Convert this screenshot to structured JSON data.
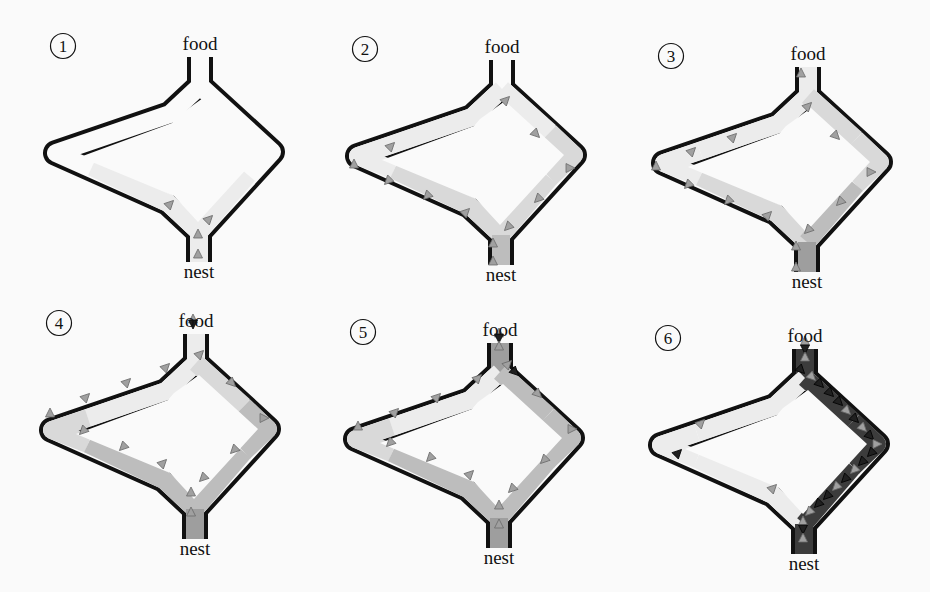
{
  "figure": {
    "background": "#fafafa",
    "wall_color": "#111111",
    "colors": {
      "none": "#fafafa",
      "faint": "#ececec",
      "light": "#d9d9d9",
      "medium": "#bdbdbd",
      "strong": "#9e9e9e",
      "dark": "#3c3c3c"
    },
    "ant_colors": {
      "gray": "#a0a0a0",
      "black": "#202020"
    }
  },
  "panels": [
    {
      "number": "①",
      "food_label": "food",
      "nest_label": "nest",
      "dx": 0,
      "dy": 0,
      "segments": {
        "top_stem": "none",
        "upper_left": "none",
        "upper_right": "none",
        "lower_left": "faint",
        "lower_right": "faint",
        "bottom_stem": "faint",
        "left_tip": "none",
        "right_tip": "none"
      },
      "ants": [
        {
          "x": 170,
          "y": 204,
          "dir": "ne",
          "c": "gray"
        },
        {
          "x": 209,
          "y": 219,
          "dir": "ne",
          "c": "gray"
        },
        {
          "x": 198,
          "y": 234,
          "dir": "n",
          "c": "gray"
        },
        {
          "x": 198,
          "y": 254,
          "dir": "n",
          "c": "gray"
        }
      ]
    },
    {
      "number": "②",
      "food_label": "food",
      "nest_label": "nest",
      "dx": 302,
      "dy": 3,
      "segments": {
        "top_stem": "none",
        "upper_left": "faint",
        "upper_right": "faint",
        "lower_left": "light",
        "lower_right": "light",
        "bottom_stem": "medium",
        "left_tip": "faint",
        "right_tip": "light"
      },
      "ants": [
        {
          "x": 204,
          "y": 97,
          "dir": "ne",
          "c": "gray"
        },
        {
          "x": 234,
          "y": 131,
          "dir": "se",
          "c": "gray"
        },
        {
          "x": 268,
          "y": 165,
          "dir": "e",
          "c": "gray"
        },
        {
          "x": 236,
          "y": 196,
          "dir": "sw",
          "c": "gray"
        },
        {
          "x": 206,
          "y": 224,
          "dir": "sw",
          "c": "gray"
        },
        {
          "x": 89,
          "y": 143,
          "dir": "ne",
          "c": "gray"
        },
        {
          "x": 52,
          "y": 161,
          "dir": "n",
          "c": "gray"
        },
        {
          "x": 86,
          "y": 178,
          "dir": "sw",
          "c": "gray"
        },
        {
          "x": 125,
          "y": 193,
          "dir": "sw",
          "c": "gray"
        },
        {
          "x": 164,
          "y": 209,
          "dir": "ne",
          "c": "gray"
        },
        {
          "x": 191,
          "y": 240,
          "dir": "n",
          "c": "gray"
        },
        {
          "x": 191,
          "y": 258,
          "dir": "n",
          "c": "gray"
        }
      ]
    },
    {
      "number": "③",
      "food_label": "food",
      "nest_label": "nest",
      "dx": 608,
      "dy": 10,
      "segments": {
        "top_stem": "faint",
        "upper_left": "faint",
        "upper_right": "light",
        "lower_left": "light",
        "lower_right": "medium",
        "bottom_stem": "strong",
        "left_tip": "faint",
        "right_tip": "light"
      },
      "ants": [
        {
          "x": 193,
          "y": 63,
          "dir": "n",
          "c": "gray"
        },
        {
          "x": 200,
          "y": 96,
          "dir": "ne",
          "c": "gray"
        },
        {
          "x": 228,
          "y": 126,
          "dir": "se",
          "c": "gray"
        },
        {
          "x": 263,
          "y": 162,
          "dir": "e",
          "c": "gray"
        },
        {
          "x": 232,
          "y": 192,
          "dir": "sw",
          "c": "gray"
        },
        {
          "x": 200,
          "y": 220,
          "dir": "sw",
          "c": "gray"
        },
        {
          "x": 125,
          "y": 127,
          "dir": "ne",
          "c": "gray"
        },
        {
          "x": 84,
          "y": 141,
          "dir": "ne",
          "c": "gray"
        },
        {
          "x": 48,
          "y": 156,
          "dir": "n",
          "c": "gray"
        },
        {
          "x": 80,
          "y": 175,
          "dir": "sw",
          "c": "gray"
        },
        {
          "x": 120,
          "y": 191,
          "dir": "sw",
          "c": "gray"
        },
        {
          "x": 160,
          "y": 205,
          "dir": "ne",
          "c": "gray"
        },
        {
          "x": 188,
          "y": 236,
          "dir": "n",
          "c": "gray"
        },
        {
          "x": 188,
          "y": 257,
          "dir": "n",
          "c": "gray"
        }
      ]
    },
    {
      "number": "④",
      "food_label": "food",
      "nest_label": "nest",
      "dx": -4,
      "dy": 277,
      "segments": {
        "top_stem": "faint",
        "upper_left": "faint",
        "upper_right": "light",
        "lower_left": "medium",
        "lower_right": "medium",
        "bottom_stem": "strong",
        "left_tip": "light",
        "right_tip": "medium"
      },
      "ants": [
        {
          "x": 197,
          "y": 42,
          "dir": "n",
          "c": "gray"
        },
        {
          "x": 197,
          "y": 47,
          "dir": "s",
          "c": "black"
        },
        {
          "x": 204,
          "y": 77,
          "dir": "ne",
          "c": "gray"
        },
        {
          "x": 170,
          "y": 90,
          "dir": "ne",
          "c": "gray"
        },
        {
          "x": 131,
          "y": 105,
          "dir": "ne",
          "c": "gray"
        },
        {
          "x": 90,
          "y": 120,
          "dir": "ne",
          "c": "gray"
        },
        {
          "x": 54,
          "y": 136,
          "dir": "n",
          "c": "gray"
        },
        {
          "x": 236,
          "y": 106,
          "dir": "se",
          "c": "gray"
        },
        {
          "x": 268,
          "y": 141,
          "dir": "e",
          "c": "gray"
        },
        {
          "x": 238,
          "y": 173,
          "dir": "sw",
          "c": "gray"
        },
        {
          "x": 207,
          "y": 201,
          "dir": "sw",
          "c": "gray"
        },
        {
          "x": 87,
          "y": 154,
          "dir": "sw",
          "c": "gray"
        },
        {
          "x": 127,
          "y": 170,
          "dir": "sw",
          "c": "gray"
        },
        {
          "x": 167,
          "y": 186,
          "dir": "ne",
          "c": "gray"
        },
        {
          "x": 195,
          "y": 215,
          "dir": "n",
          "c": "gray"
        },
        {
          "x": 195,
          "y": 235,
          "dir": "n",
          "c": "gray"
        }
      ]
    },
    {
      "number": "⑤",
      "food_label": "food",
      "nest_label": "nest",
      "dx": 300,
      "dy": 286,
      "segments": {
        "top_stem": "strong",
        "upper_left": "faint",
        "upper_right": "medium",
        "lower_left": "medium",
        "lower_right": "medium",
        "bottom_stem": "strong",
        "left_tip": "light",
        "right_tip": "medium"
      },
      "ants": [
        {
          "x": 199,
          "y": 47,
          "dir": "n",
          "c": "gray"
        },
        {
          "x": 199,
          "y": 52,
          "dir": "s",
          "c": "black"
        },
        {
          "x": 199,
          "y": 60,
          "dir": "n",
          "c": "gray"
        },
        {
          "x": 208,
          "y": 78,
          "dir": "ne",
          "c": "gray"
        },
        {
          "x": 215,
          "y": 86,
          "dir": "se",
          "c": "black"
        },
        {
          "x": 178,
          "y": 92,
          "dir": "ne",
          "c": "gray"
        },
        {
          "x": 137,
          "y": 111,
          "dir": "ne",
          "c": "gray"
        },
        {
          "x": 95,
          "y": 126,
          "dir": "ne",
          "c": "gray"
        },
        {
          "x": 58,
          "y": 140,
          "dir": "n",
          "c": "gray"
        },
        {
          "x": 238,
          "y": 108,
          "dir": "se",
          "c": "gray"
        },
        {
          "x": 272,
          "y": 143,
          "dir": "e",
          "c": "gray"
        },
        {
          "x": 244,
          "y": 174,
          "dir": "sw",
          "c": "gray"
        },
        {
          "x": 212,
          "y": 203,
          "dir": "sw",
          "c": "gray"
        },
        {
          "x": 90,
          "y": 157,
          "dir": "sw",
          "c": "gray"
        },
        {
          "x": 130,
          "y": 172,
          "dir": "sw",
          "c": "gray"
        },
        {
          "x": 170,
          "y": 188,
          "dir": "ne",
          "c": "gray"
        },
        {
          "x": 199,
          "y": 219,
          "dir": "n",
          "c": "gray"
        },
        {
          "x": 199,
          "y": 238,
          "dir": "n",
          "c": "gray"
        }
      ]
    },
    {
      "number": "⑥",
      "food_label": "food",
      "nest_label": "nest",
      "dx": 605,
      "dy": 292,
      "segments": {
        "top_stem": "dark",
        "upper_left": "faint",
        "upper_right": "dark",
        "lower_left": "faint",
        "lower_right": "dark",
        "bottom_stem": "dark",
        "left_tip": "faint",
        "right_tip": "dark"
      },
      "ants": [
        {
          "x": 200,
          "y": 49,
          "dir": "n",
          "c": "gray"
        },
        {
          "x": 200,
          "y": 57,
          "dir": "s",
          "c": "black"
        },
        {
          "x": 200,
          "y": 65,
          "dir": "n",
          "c": "gray"
        },
        {
          "x": 196,
          "y": 78,
          "dir": "se",
          "c": "black"
        },
        {
          "x": 207,
          "y": 85,
          "dir": "se",
          "c": "gray"
        },
        {
          "x": 215,
          "y": 92,
          "dir": "se",
          "c": "black"
        },
        {
          "x": 225,
          "y": 101,
          "dir": "se",
          "c": "black"
        },
        {
          "x": 234,
          "y": 110,
          "dir": "se",
          "c": "black"
        },
        {
          "x": 242,
          "y": 119,
          "dir": "se",
          "c": "gray"
        },
        {
          "x": 250,
          "y": 127,
          "dir": "se",
          "c": "black"
        },
        {
          "x": 258,
          "y": 136,
          "dir": "se",
          "c": "gray"
        },
        {
          "x": 265,
          "y": 144,
          "dir": "se",
          "c": "black"
        },
        {
          "x": 272,
          "y": 152,
          "dir": "e",
          "c": "gray"
        },
        {
          "x": 266,
          "y": 161,
          "dir": "sw",
          "c": "black"
        },
        {
          "x": 257,
          "y": 170,
          "dir": "sw",
          "c": "black"
        },
        {
          "x": 249,
          "y": 178,
          "dir": "sw",
          "c": "gray"
        },
        {
          "x": 240,
          "y": 187,
          "dir": "sw",
          "c": "black"
        },
        {
          "x": 231,
          "y": 195,
          "dir": "sw",
          "c": "gray"
        },
        {
          "x": 222,
          "y": 204,
          "dir": "sw",
          "c": "black"
        },
        {
          "x": 213,
          "y": 212,
          "dir": "sw",
          "c": "black"
        },
        {
          "x": 204,
          "y": 220,
          "dir": "sw",
          "c": "gray"
        },
        {
          "x": 198,
          "y": 229,
          "dir": "n",
          "c": "gray"
        },
        {
          "x": 198,
          "y": 237,
          "dir": "s",
          "c": "black"
        },
        {
          "x": 198,
          "y": 246,
          "dir": "n",
          "c": "gray"
        },
        {
          "x": 96,
          "y": 131,
          "dir": "ne",
          "c": "gray"
        },
        {
          "x": 73,
          "y": 161,
          "dir": "ne",
          "c": "black"
        },
        {
          "x": 168,
          "y": 196,
          "dir": "ne",
          "c": "gray"
        }
      ]
    }
  ]
}
